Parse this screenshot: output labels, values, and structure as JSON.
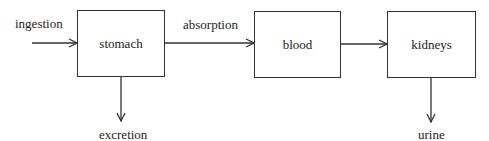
{
  "diagram": {
    "type": "flow",
    "nodes": [
      {
        "id": "stomach",
        "label": "stomach"
      },
      {
        "id": "blood",
        "label": "blood"
      },
      {
        "id": "kidneys",
        "label": "kidneys"
      }
    ],
    "edges": [
      {
        "from": "external",
        "to": "stomach",
        "label": "ingestion"
      },
      {
        "from": "stomach",
        "to": "blood",
        "label": "absorption"
      },
      {
        "from": "stomach",
        "to": "external",
        "label": "excretion"
      },
      {
        "from": "blood",
        "to": "kidneys",
        "label": ""
      },
      {
        "from": "kidneys",
        "to": "external",
        "label": "urine"
      }
    ],
    "colors": {
      "stroke": "#333333",
      "text": "#222222",
      "background": "#ffffff"
    }
  }
}
